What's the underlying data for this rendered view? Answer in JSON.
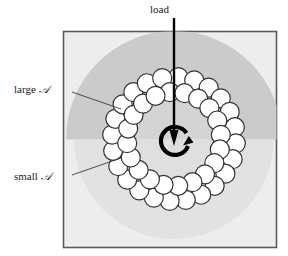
{
  "figure": {
    "title_text": "Bearing load diagram",
    "frame": {
      "x": 63,
      "y": 31,
      "width": 214,
      "height": 217,
      "border_color": "#555555",
      "fill_color": "#eeeeee"
    },
    "regions": [
      {
        "name": "outer-background-square",
        "fill": "#ededed",
        "note": "light gray square field"
      },
      {
        "name": "large-contact-zone",
        "fill": "#cccccc",
        "note": "darker gray upper half-disc, large contact area"
      },
      {
        "name": "small-contact-zone",
        "fill": "#dedede",
        "note": "lighter gray lower half-disc, small contact area"
      },
      {
        "name": "inner-disc",
        "fill": "#e4e4e4"
      }
    ],
    "balls": {
      "outer_ring_count": 24,
      "inner_ring_count": 20,
      "fill": "#ffffff",
      "stroke": "#333333",
      "outer_ring_radius": 62,
      "inner_ring_radius": 47,
      "ball_radius": 9.5,
      "center_x": 174,
      "center_y": 139
    },
    "load_arrow": {
      "from_x": 174,
      "from_y": 18,
      "to_x": 174,
      "to_y": 143,
      "color": "#000000"
    },
    "rotation_arrow": {
      "center_x": 174,
      "center_y": 140,
      "radius": 14,
      "color": "#000000",
      "direction": "clockwise"
    }
  },
  "labels": {
    "load": "load",
    "large_prefix": "large ",
    "large_symbol": "𝒜",
    "small_prefix": "small ",
    "small_symbol": "𝒜"
  },
  "leaders": [
    {
      "name": "leader-large-a",
      "x1": 72,
      "y1": 92,
      "x2": 121,
      "y2": 109
    },
    {
      "name": "leader-small-a",
      "x1": 72,
      "y1": 175,
      "x2": 121,
      "y2": 158
    }
  ],
  "colors": {
    "ink": "#1a1a1a",
    "frame_border": "#555555",
    "field": "#ededed",
    "large_zone": "#cccccc",
    "small_zone": "#dedede",
    "ball_fill": "#ffffff",
    "ball_stroke": "#333333"
  }
}
